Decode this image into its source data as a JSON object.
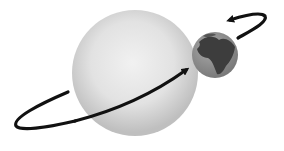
{
  "diagram": {
    "description": "A large pale sphere with an Earth-like planet at its upper-right edge; a black curved arrow orbits around the large sphere, ending at the planet, and a second curved arrow loops around the planet.",
    "large_sphere": {
      "label": "",
      "fill_center": "#ededed",
      "fill_edge": "#bdbdbd"
    },
    "planet": {
      "label": "",
      "ocean_color": "#8a8a8a",
      "land_color": "#3c3c3c"
    },
    "orbit_arrow": {
      "label": "",
      "color": "#111111"
    },
    "spin_arrow": {
      "label": "",
      "color": "#111111"
    }
  }
}
